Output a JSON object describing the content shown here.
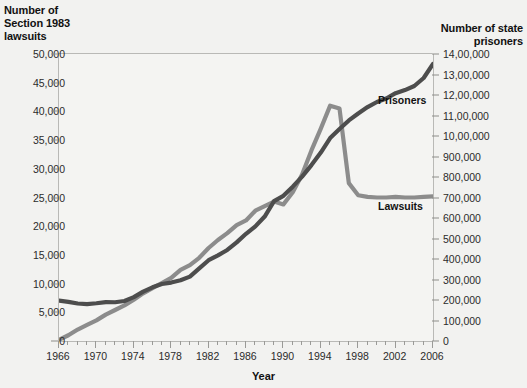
{
  "chart_data": {
    "type": "line",
    "title": "",
    "xlabel": "Year",
    "ylabel_left": "Number of\nSection 1983\nlawsuits",
    "ylabel_right": "Number of state\nprisoners",
    "xlim": [
      1966,
      2006
    ],
    "ylim_left": [
      0,
      50000
    ],
    "ylim_right": [
      0,
      1400000
    ],
    "grid": false,
    "legend_position": "inline-right",
    "x_tick_labels": [
      "1966",
      "1970",
      "1974",
      "1978",
      "1982",
      "1986",
      "1990",
      "1994",
      "1998",
      "2002",
      "2006"
    ],
    "x_major_ticks": [
      1966,
      1970,
      1974,
      1978,
      1982,
      1986,
      1990,
      1994,
      1998,
      2002,
      2006
    ],
    "y_left_tick_labels": [
      "0",
      "5,000",
      "10,000",
      "15,000",
      "20,000",
      "25,000",
      "30,000",
      "35,000",
      "40,000",
      "45,000",
      "50,000"
    ],
    "y_left_tick_values": [
      0,
      5000,
      10000,
      15000,
      20000,
      25000,
      30000,
      35000,
      40000,
      45000,
      50000
    ],
    "y_right_tick_labels": [
      "0",
      "100,000",
      "200,000",
      "300,000",
      "400,000",
      "500,000",
      "600,000",
      "700,000",
      "800,000",
      "900,000",
      "10,00,000",
      "11,00,000",
      "12,00,000",
      "13,00,000",
      "14,00,000"
    ],
    "y_right_tick_values": [
      0,
      100000,
      200000,
      300000,
      400000,
      500000,
      600000,
      700000,
      800000,
      900000,
      1000000,
      1100000,
      1200000,
      1300000,
      1400000
    ],
    "x": [
      1966,
      1967,
      1968,
      1969,
      1970,
      1971,
      1972,
      1973,
      1974,
      1975,
      1976,
      1977,
      1978,
      1979,
      1980,
      1981,
      1982,
      1983,
      1984,
      1985,
      1986,
      1987,
      1988,
      1989,
      1990,
      1991,
      1992,
      1993,
      1994,
      1995,
      1996,
      1997,
      1998,
      1999,
      2000,
      2001,
      2002,
      2003,
      2004,
      2005,
      2006
    ],
    "series": [
      {
        "name": "Lawsuits",
        "axis": "left",
        "color": "#8c8c8c",
        "values": [
          218,
          1000,
          2000,
          2800,
          3600,
          4600,
          5400,
          6200,
          7200,
          8300,
          9200,
          10100,
          11000,
          12400,
          13200,
          14500,
          16200,
          17600,
          18800,
          20200,
          21000,
          22700,
          23500,
          24300,
          23800,
          25900,
          29000,
          33200,
          37000,
          41000,
          40500,
          27500,
          25400,
          25100,
          25000,
          25000,
          25100,
          25000,
          25000,
          25100,
          25200
        ]
      },
      {
        "name": "Prisoners",
        "axis": "right",
        "color": "#4d4d4d",
        "values": [
          197000,
          191000,
          183000,
          180000,
          184000,
          190000,
          189000,
          195000,
          214000,
          241000,
          262000,
          278000,
          285000,
          296000,
          314000,
          354000,
          394000,
          418000,
          444000,
          481000,
          523000,
          559000,
          607000,
          682000,
          708000,
          753000,
          802000,
          858000,
          919000,
          990000,
          1034000,
          1076000,
          1110000,
          1141000,
          1166000,
          1183000,
          1209000,
          1224000,
          1244000,
          1283000,
          1352000
        ]
      }
    ],
    "annotations": [
      {
        "text": "Prisoners",
        "x": 2000,
        "series": "Prisoners"
      },
      {
        "text": "Lawsuits",
        "x": 2000,
        "series": "Lawsuits"
      }
    ]
  },
  "axis_titles": {
    "left_line1": "Number of",
    "left_line2": "Section 1983",
    "left_line3": "lawsuits",
    "right_line1": "Number of state",
    "right_line2": "prisoners",
    "x": "Year"
  },
  "series_labels": {
    "prisoners": "Prisoners",
    "lawsuits": "Lawsuits"
  },
  "watermark": ""
}
